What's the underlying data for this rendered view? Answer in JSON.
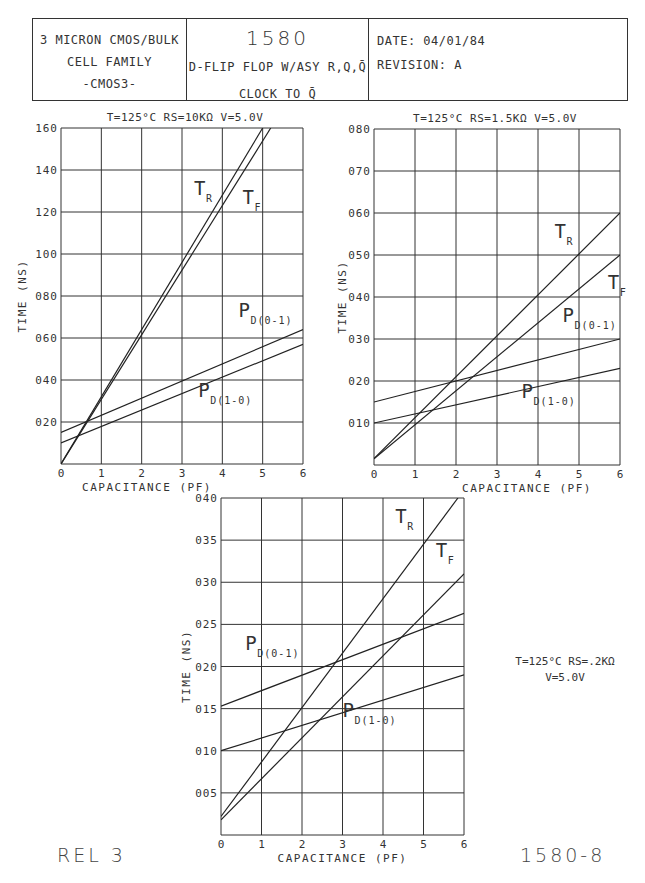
{
  "header": {
    "left_lines": [
      "3 MICRON CMOS/BULK",
      "CELL FAMILY",
      "-CMOS3-"
    ],
    "cell_number": "1580",
    "cell_desc": "D-FLIP FLOP W/ASY R,Q,Q̄",
    "cell_path": "CLOCK TO Q̄",
    "date": "DATE: 04/01/84",
    "revision": "REVISION: A"
  },
  "footer": {
    "left": "REL 3",
    "right": "1580-8"
  },
  "side_note": {
    "line1": "T=125°C RS=.2KΩ",
    "line2": "V=5.0V"
  },
  "chart_data": [
    {
      "type": "line",
      "title": "T=125°C RS=10KΩ V=5.0V",
      "xlabel": "CAPACITANCE (PF)",
      "ylabel": "TIME (NS)",
      "xlim": [
        0,
        6
      ],
      "ylim": [
        0,
        160
      ],
      "xticks": [
        "0",
        "1",
        "2",
        "3",
        "4",
        "5",
        "6"
      ],
      "yticks": [
        "020",
        "040",
        "060",
        "080",
        "100",
        "120",
        "140",
        "160"
      ],
      "grid": true,
      "series": [
        {
          "name": "TR",
          "x": [
            0,
            5.0
          ],
          "y": [
            0,
            160
          ]
        },
        {
          "name": "TF",
          "x": [
            0,
            5.2
          ],
          "y": [
            0,
            160
          ]
        },
        {
          "name": "PD(0-1)",
          "x": [
            0,
            6
          ],
          "y": [
            15,
            64
          ]
        },
        {
          "name": "PD(1-0)",
          "x": [
            0,
            6
          ],
          "y": [
            10,
            57
          ]
        }
      ],
      "labels": [
        {
          "text": "TR",
          "x": 3.3,
          "y": 128
        },
        {
          "text": "TF",
          "x": 4.5,
          "y": 124
        },
        {
          "text": "PD(0-1)",
          "x": 4.4,
          "y": 70
        },
        {
          "text": "PD(1-0)",
          "x": 3.4,
          "y": 32
        }
      ]
    },
    {
      "type": "line",
      "title": "T=125°C RS=1.5KΩ V=5.0V",
      "xlabel": "CAPACITANCE (PF)",
      "ylabel": "TIME (NS)",
      "xlim": [
        0,
        6
      ],
      "ylim": [
        0,
        80
      ],
      "xticks": [
        "0",
        "1",
        "2",
        "3",
        "4",
        "5",
        "6"
      ],
      "yticks": [
        "010",
        "020",
        "030",
        "040",
        "050",
        "060",
        "070",
        "080"
      ],
      "grid": true,
      "series": [
        {
          "name": "TR",
          "x": [
            0,
            6
          ],
          "y": [
            1.5,
            60
          ]
        },
        {
          "name": "TF",
          "x": [
            0,
            6
          ],
          "y": [
            1.5,
            50
          ]
        },
        {
          "name": "PD(0-1)",
          "x": [
            0,
            6
          ],
          "y": [
            15,
            30
          ]
        },
        {
          "name": "PD(1-0)",
          "x": [
            0,
            6
          ],
          "y": [
            10,
            23
          ]
        }
      ],
      "labels": [
        {
          "text": "TR",
          "x": 4.4,
          "y": 54
        },
        {
          "text": "TF",
          "x": 5.7,
          "y": 42
        },
        {
          "text": "PD(0-1)",
          "x": 4.6,
          "y": 34
        },
        {
          "text": "PD(1-0)",
          "x": 3.6,
          "y": 16
        }
      ]
    },
    {
      "type": "line",
      "title": "T=125°C RS=.2KΩ V=5.0V",
      "xlabel": "CAPACITANCE (PF)",
      "ylabel": "TIME (NS)",
      "xlim": [
        0,
        6
      ],
      "ylim": [
        0,
        40
      ],
      "xticks": [
        "0",
        "1",
        "2",
        "3",
        "4",
        "5",
        "6"
      ],
      "yticks": [
        "005",
        "010",
        "015",
        "020",
        "025",
        "030",
        "035",
        "040"
      ],
      "grid": true,
      "series": [
        {
          "name": "TR",
          "x": [
            0,
            5.85
          ],
          "y": [
            2.2,
            40
          ]
        },
        {
          "name": "TF",
          "x": [
            0,
            6
          ],
          "y": [
            1.8,
            31
          ]
        },
        {
          "name": "PD(0-1)",
          "x": [
            0,
            6
          ],
          "y": [
            15.3,
            26.3
          ]
        },
        {
          "name": "PD(1-0)",
          "x": [
            0,
            6
          ],
          "y": [
            10,
            19
          ]
        }
      ],
      "labels": [
        {
          "text": "TR",
          "x": 4.3,
          "y": 37
        },
        {
          "text": "TF",
          "x": 5.3,
          "y": 33
        },
        {
          "text": "PD(0-1)",
          "x": 0.6,
          "y": 22
        },
        {
          "text": "PD(1-0)",
          "x": 3.0,
          "y": 14
        }
      ]
    }
  ]
}
